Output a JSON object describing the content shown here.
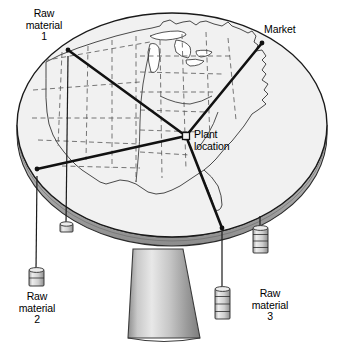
{
  "figure": {
    "map_region": "United States",
    "colors": {
      "table_top": "#f1f1f1",
      "table_edge": "#b9b9b9",
      "table_edge_dark": "#8a8a8a",
      "pedestal_light": "#e6e6e6",
      "pedestal_mid": "#b5b5b5",
      "pedestal_dark": "#7e7e7e",
      "weight_fill": "#dcdcdc",
      "line": "#111111",
      "outline": "#1a1a1a"
    }
  },
  "labels": {
    "raw_material_1": "Raw\nmaterial\n1",
    "raw_material_2": "Raw\nmaterial\n2",
    "raw_material_3": "Raw\nmaterial\n3",
    "market": "Market",
    "plant_location": "Plant\nlocation"
  },
  "nodes": [
    {
      "id": "raw-material-1",
      "label": "Raw material 1",
      "x": 68,
      "y": 50,
      "weights": 1
    },
    {
      "id": "market",
      "label": "Market",
      "x": 262,
      "y": 43,
      "weights": 4
    },
    {
      "id": "raw-material-2",
      "label": "Raw material 2",
      "x": 37,
      "y": 169,
      "weights": 2
    },
    {
      "id": "raw-material-3",
      "label": "Raw material 3",
      "x": 222,
      "y": 228,
      "weights": 4
    },
    {
      "id": "plant-location",
      "label": "Plant location",
      "x": 186,
      "y": 136,
      "weights": 0
    }
  ],
  "strings": [
    {
      "id": "string-raw-material-1",
      "from_x": 68,
      "from_y": 58,
      "to_x": 66,
      "to_y": 224
    },
    {
      "id": "string-raw-material-2",
      "from_x": 37,
      "from_y": 178,
      "to_x": 36,
      "to_y": 270
    },
    {
      "id": "string-raw-material-3",
      "from_x": 222,
      "from_y": 234,
      "to_x": 222,
      "to_y": 288
    },
    {
      "id": "string-market",
      "from_x": 260,
      "from_y": 218,
      "to_x": 260,
      "to_y": 227
    }
  ]
}
